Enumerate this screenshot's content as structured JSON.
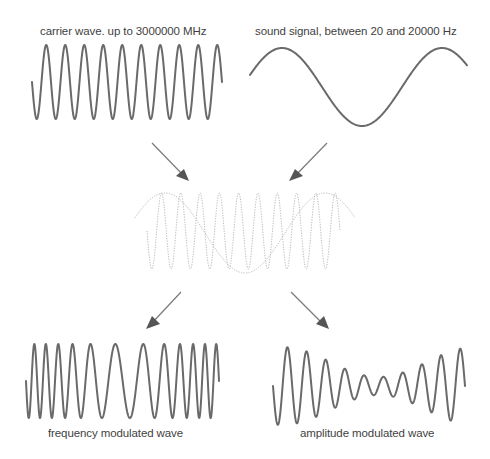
{
  "labels": {
    "carrier": "carrier wave. up to 3000000 MHz",
    "sound": "sound signal, between 20 and 20000 Hz",
    "fm": "frequency modulated wave",
    "am": "amplitude modulated wave"
  },
  "waves": {
    "carrier": {
      "cycles": 10,
      "description": "high-frequency constant-amplitude sine"
    },
    "sound": {
      "cycles": 1.5,
      "description": "low-frequency sine"
    },
    "combined": {
      "style": "dotted",
      "description": "carrier overlaid on sound signal"
    },
    "fm": {
      "cycles": 12,
      "description": "frequency varies with sound signal, amplitude constant"
    },
    "am": {
      "cycles": 10,
      "description": "amplitude varies with sound signal, frequency constant"
    }
  },
  "arrows": [
    {
      "from": "carrier",
      "to": "combined"
    },
    {
      "from": "sound",
      "to": "combined"
    },
    {
      "from": "combined",
      "to": "fm"
    },
    {
      "from": "combined",
      "to": "am"
    }
  ],
  "colors": {
    "wave": "#6a6a6a",
    "dotted": "#b8b8b8",
    "arrow": "#555555",
    "text": "#3f3f3f"
  }
}
